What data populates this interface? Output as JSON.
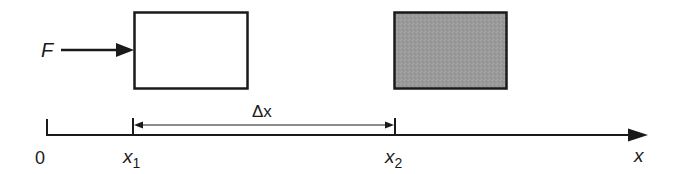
{
  "diagram": {
    "colors": {
      "stroke": "#1a1a1a",
      "block_initial_fill": "#ffffff",
      "block_final_fill": "#9a9a9a",
      "background": "#ffffff"
    },
    "force": {
      "label": "F"
    },
    "blocks": [
      {
        "name": "initial-block",
        "state": "initial position",
        "fill": "white"
      },
      {
        "name": "final-block",
        "state": "final position",
        "fill": "gray"
      }
    ],
    "axis": {
      "origin_label": "0",
      "axis_label": "x",
      "ticks": [
        {
          "base": "x",
          "sub": "1"
        },
        {
          "base": "x",
          "sub": "2"
        }
      ]
    },
    "displacement": {
      "label": "Δx"
    }
  }
}
